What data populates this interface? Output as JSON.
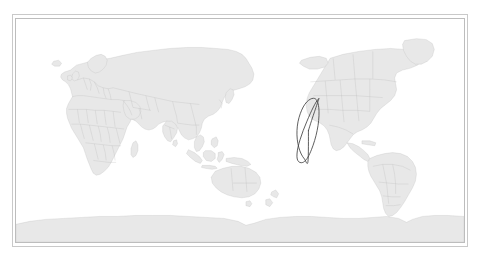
{
  "figure": {
    "title": "",
    "type": "world-map",
    "projection": "equirectangular",
    "center_longitude": 60,
    "lon_range": [
      -120,
      240
    ],
    "lat_range": [
      -90,
      90
    ],
    "background_color": "#ffffff",
    "land_fill": "#e8e8e8",
    "land_stroke": "#b9b9b9",
    "border_color": "#c9c9c9",
    "panel_border_color": "#bdbdbd"
  },
  "overlay": {
    "name": "satellite-ground-track",
    "shape": "analemma-figure-eight",
    "stroke_color": "#3f3f3f",
    "stroke_width": 0.85,
    "center_longitude_deg": 115,
    "center_latitude_deg": 0,
    "longitude_half_width_deg": 13,
    "latitude_extent_deg": 52,
    "crossing_point": {
      "lon": 115,
      "lat": 0
    },
    "bounds_px": {
      "x_min": 180,
      "x_max": 214,
      "y_min": 58,
      "y_max": 187
    }
  },
  "regions": {
    "visible_continents": [
      "Africa",
      "Europe",
      "Asia",
      "Australia",
      "North America",
      "South America",
      "Antarctica"
    ]
  },
  "chart_data": {
    "type": "line",
    "title": "",
    "xlabel": "",
    "ylabel": "",
    "xlim": [
      -120,
      240
    ],
    "ylim": [
      -90,
      90
    ],
    "grid": false,
    "legend": "none",
    "series": [
      {
        "name": "satellite-ground-track",
        "x": [
          115.0,
          117.5,
          120.0,
          122.0,
          123.2,
          123.5,
          122.8,
          121.2,
          119.0,
          116.4,
          113.6,
          110.8,
          108.4,
          106.6,
          105.8,
          106.0,
          107.2,
          109.2,
          111.8,
          114.6,
          117.4,
          120.0,
          122.0,
          123.2,
          123.5,
          122.8,
          121.2,
          119.0,
          116.4,
          113.6,
          110.8,
          108.4,
          106.6,
          105.8,
          106.0,
          107.2,
          109.2,
          111.8,
          114.6,
          115.0
        ],
        "y": [
          0.0,
          8.0,
          15.5,
          21.5,
          25.0,
          26.0,
          25.2,
          23.0,
          19.0,
          13.5,
          7.0,
          0.0,
          -7.0,
          -13.5,
          -19.0,
          -23.0,
          -25.2,
          -26.0,
          -25.0,
          -21.5,
          -15.5,
          -8.0,
          0.0,
          8.0,
          15.5,
          21.5,
          25.0,
          26.0,
          25.2,
          23.0,
          19.0,
          13.5,
          7.0,
          0.0,
          -7.0,
          -13.5,
          -19.0,
          -23.0,
          -25.2,
          0.0
        ]
      }
    ]
  }
}
